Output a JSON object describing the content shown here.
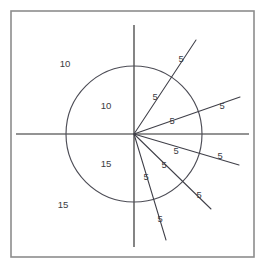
{
  "figure": {
    "title": "",
    "background_color": "#ffffff",
    "frame": {
      "x": 11,
      "y": 11,
      "width": 243,
      "height": 246,
      "stroke_color": "#8d8d8d"
    },
    "origin": {
      "x": 134,
      "y": 134
    },
    "circle": {
      "center_x": 134,
      "center_y": 134,
      "radius": 68,
      "stroke_color": "#4d4d56"
    },
    "axes": {
      "stroke_color": "#6f6f6f",
      "horizontal": {
        "x1": 16,
        "y1": 134,
        "x2": 249,
        "y2": 134
      },
      "vertical": {
        "x1": 134,
        "y1": 25,
        "x2": 134,
        "y2": 247
      }
    }
  },
  "chart_data": {
    "type": "scatter",
    "title": "",
    "xlabel": "",
    "ylabel": "",
    "region_labels": [
      {
        "text": "10",
        "x": 65,
        "y": 64,
        "quadrant": "upper-left",
        "location": "outside-circle"
      },
      {
        "text": "10",
        "x": 106,
        "y": 106,
        "quadrant": "upper-left",
        "location": "inside-circle"
      },
      {
        "text": "15",
        "x": 106,
        "y": 164,
        "quadrant": "lower-left",
        "location": "inside-circle"
      },
      {
        "text": "15",
        "x": 63,
        "y": 205,
        "quadrant": "lower-left",
        "location": "outside-circle"
      }
    ],
    "rays": [
      {
        "id": "ray-1",
        "angle_deg": 62,
        "inner_label": {
          "text": "5",
          "x": 155,
          "y": 98
        },
        "outer_label": {
          "text": "5",
          "x": 181,
          "y": 60
        },
        "x1": 134,
        "y1": 134,
        "x2": 196,
        "y2": 40
      },
      {
        "id": "ray-2",
        "angle_deg": 20,
        "inner_label": {
          "text": "5",
          "x": 172,
          "y": 122
        },
        "outer_label": {
          "text": "5",
          "x": 222,
          "y": 107
        },
        "x1": 134,
        "y1": 134,
        "x2": 240,
        "y2": 97
      },
      {
        "id": "ray-3",
        "angle_deg": -18,
        "inner_label": {
          "text": "5",
          "x": 176,
          "y": 152
        },
        "outer_label": {
          "text": "5",
          "x": 220,
          "y": 157
        },
        "x1": 134,
        "y1": 134,
        "x2": 239,
        "y2": 165
      },
      {
        "id": "ray-4",
        "angle_deg": -46,
        "inner_label": {
          "text": "5",
          "x": 164,
          "y": 166
        },
        "outer_label": {
          "text": "5",
          "x": 199,
          "y": 196
        },
        "x1": 134,
        "y1": 134,
        "x2": 211,
        "y2": 209
      },
      {
        "id": "ray-5",
        "angle_deg": -74,
        "inner_label": {
          "text": "5",
          "x": 146,
          "y": 178
        },
        "outer_label": {
          "text": "5",
          "x": 160,
          "y": 220
        },
        "x1": 134,
        "y1": 134,
        "x2": 166,
        "y2": 240
      }
    ]
  }
}
